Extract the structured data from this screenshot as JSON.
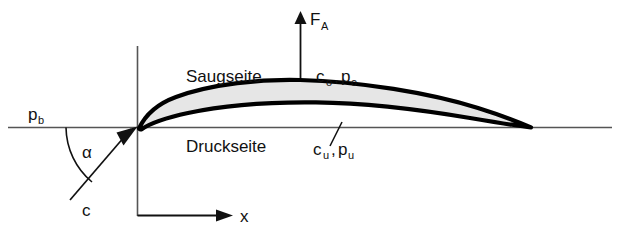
{
  "figure": {
    "background_color": "#ffffff",
    "line_color": "#111111",
    "airfoil_fill_color": "#e6e6e6",
    "airfoil_outline_color": "#000000",
    "axis_color": "#555555"
  },
  "labels": {
    "lift_force": {
      "symbol": "F",
      "subscript": "A"
    },
    "upper_side": {
      "text": "Saugseite"
    },
    "lower_side": {
      "text": "Druckseite"
    },
    "upper_flow": {
      "velocity": "c",
      "velocity_sub": "o",
      "comma": ",",
      "pressure": "p",
      "pressure_sub": "o"
    },
    "lower_flow": {
      "velocity": "c",
      "velocity_sub": "u",
      "comma": ",",
      "pressure": "p",
      "pressure_sub": "u"
    },
    "ambient_pressure": {
      "symbol": "p",
      "subscript": "b"
    },
    "angle_of_attack": {
      "symbol": "α"
    },
    "inflow_velocity": {
      "symbol": "c"
    },
    "x_axis": {
      "symbol": "x"
    }
  },
  "annotations": {
    "vertical_axis": "y-axis construction line",
    "horizontal_axis": "chord reference line",
    "angle_arc": "angle of attack arc between inflow vector and chord line"
  }
}
